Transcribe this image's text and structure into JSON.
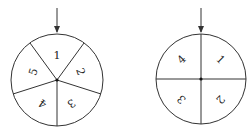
{
  "spinners": [
    {
      "name": "five-sector-spinner",
      "sectors": [
        "1",
        "2",
        "3",
        "4",
        "5"
      ]
    },
    {
      "name": "four-sector-spinner",
      "sectors": [
        "1",
        "2",
        "3",
        "4"
      ]
    }
  ],
  "colors": {
    "stroke": "#333333",
    "background": "#ffffff"
  }
}
